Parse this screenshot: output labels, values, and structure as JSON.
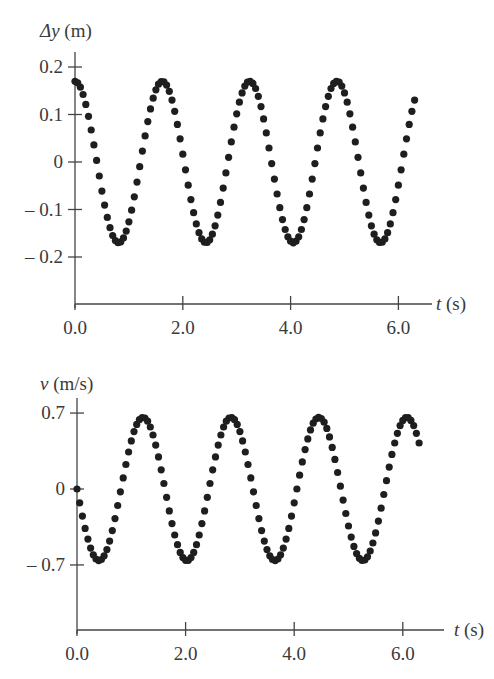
{
  "chart_data": [
    {
      "type": "scatter",
      "title": "",
      "ylabel": "Δy (m)",
      "xlabel": "t (s)",
      "ylabel_var": "Δy",
      "ylabel_unit": "(m)",
      "xlabel_var": "t",
      "xlabel_unit": "(s)",
      "xlim": [
        0,
        6.6
      ],
      "ylim": [
        -0.3,
        0.2
      ],
      "xticks": [
        "0.0",
        "2.0",
        "4.0",
        "6.0"
      ],
      "yticks": [
        "0.2",
        "0.1",
        "0",
        "-0.1",
        "-0.2"
      ],
      "grid": false,
      "legend": null,
      "model": "Δy = 0.17 cos(2π t / 1.62)",
      "amplitude": 0.17,
      "period": 1.62,
      "t_start": 0.0,
      "t_end": 6.3,
      "dt": 0.05,
      "series": [
        {
          "name": "Δy",
          "peaks_t": [
            0.0,
            1.6,
            3.2,
            4.8
          ],
          "troughs_t": [
            0.8,
            2.4,
            4.05,
            5.65
          ],
          "peak_value": 0.17,
          "trough_value": -0.17
        }
      ]
    },
    {
      "type": "scatter",
      "title": "",
      "ylabel": "v (m/s)",
      "xlabel": "t (s)",
      "ylabel_var": "v",
      "ylabel_unit": "(m/s)",
      "xlabel_var": "t",
      "xlabel_unit": "(s)",
      "xlim": [
        0,
        6.6
      ],
      "ylim": [
        -1.5,
        0.7
      ],
      "xticks": [
        "0.0",
        "2.0",
        "4.0",
        "6.0"
      ],
      "yticks": [
        "0.7",
        "0",
        "-0.7"
      ],
      "grid": false,
      "legend": null,
      "model": "v = -0.66 sin(2π t / 1.62)",
      "amplitude": 0.66,
      "period": 1.62,
      "t_start": 0.0,
      "t_end": 6.3,
      "dt": 0.05,
      "series": [
        {
          "name": "v",
          "peaks_t": [
            1.2,
            2.8,
            4.4,
            6.05
          ],
          "troughs_t": [
            0.4,
            2.0,
            3.65,
            5.25
          ],
          "peak_value": 0.6,
          "trough_value": -0.63
        }
      ]
    }
  ],
  "top": {
    "ylabel_var": "Δy",
    "ylabel_unit": " (m)",
    "xlabel_var": "t",
    "xlabel_unit": " (s)"
  },
  "bottom": {
    "ylabel_var": "v",
    "ylabel_unit": " (m/s)",
    "xlabel_var": "t",
    "xlabel_unit": " (s)"
  }
}
